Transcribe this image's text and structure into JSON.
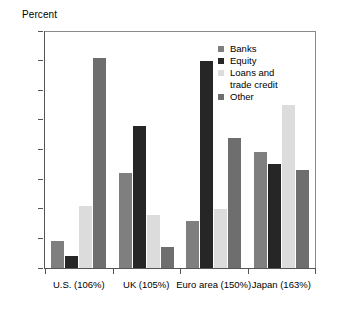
{
  "chart_data": {
    "type": "bar",
    "title": "",
    "subtitle": "",
    "xlabel": "",
    "ylabel": "Percent",
    "ylim": [
      0,
      80
    ],
    "yticks": [
      0,
      10,
      20,
      30,
      40,
      50,
      60,
      70,
      80
    ],
    "grid": false,
    "legend_position": "top-right",
    "categories": [
      "U.S. (106%)",
      "UK (105%)",
      "Euro area (150%)",
      "Japan (163%)"
    ],
    "series": [
      {
        "name": "Banks",
        "color": "#7f7f7f",
        "values": [
          9,
          32,
          16,
          39
        ]
      },
      {
        "name": "Equity",
        "color": "#262626",
        "values": [
          4,
          48,
          70,
          35
        ]
      },
      {
        "name": "Loans and\ntrade credit",
        "color": "#dcdcdc",
        "values": [
          21,
          18,
          20,
          55
        ]
      },
      {
        "name": "Other",
        "color": "#6e6e6e",
        "values": [
          71,
          7,
          44,
          33
        ]
      }
    ]
  },
  "legend": {
    "items": [
      {
        "label": "Banks"
      },
      {
        "label": "Equity"
      },
      {
        "label": "Loans and\ntrade credit"
      },
      {
        "label": "Other"
      }
    ]
  },
  "axes": {
    "y_title": "Percent",
    "y_tick_labels": [
      "80",
      "70",
      "60",
      "50",
      "40",
      "30",
      "20",
      "10",
      "0"
    ],
    "x_tick_labels": [
      "U.S. (106%)",
      "UK (105%)",
      "Euro area (150%)",
      "Japan (163%)"
    ]
  },
  "colors": {
    "banks": "#7f7f7f",
    "equity": "#262626",
    "loans_trade_credit": "#dcdcdc",
    "other": "#6e6e6e",
    "axis": "#555555",
    "frame": "#8a8a8a",
    "background": "#ffffff"
  }
}
